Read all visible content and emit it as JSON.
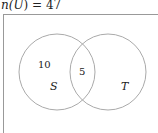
{
  "title": {
    "prefix": "n(",
    "set": "U",
    "suffix": ") = 47",
    "full": "n(U) = 47"
  },
  "diagram": {
    "type": "venn",
    "universe_size": 47,
    "sets": [
      {
        "name": "S",
        "label": "S"
      },
      {
        "name": "T",
        "label": "T"
      }
    ],
    "regions": {
      "S_only": "10",
      "S_and_T": "5",
      "T_only": ""
    },
    "colors": {
      "stroke": "#aaaaaa",
      "border": "#999999",
      "text": "#222222"
    }
  }
}
